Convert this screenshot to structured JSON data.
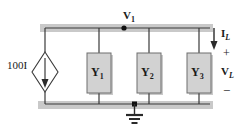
{
  "figure": {
    "colors": {
      "wire": "#3a3a3a",
      "box_fill": "#d2d2d2",
      "box_border": "#6e6e6e",
      "shadow": "#c9c9c9",
      "background": "#ffffff",
      "text": "#1a1a1a"
    }
  },
  "labels": {
    "source": "100I",
    "node_voltage": "V",
    "node_voltage_sub": "1",
    "load_current": "I",
    "load_current_sub": "L",
    "load_voltage": "V",
    "load_voltage_sub": "L",
    "polarity_plus": "+",
    "polarity_minus": "−"
  },
  "elements": [
    {
      "name": "admittance-1",
      "symbol": "Y",
      "subscript": "1"
    },
    {
      "name": "admittance-2",
      "symbol": "Y",
      "subscript": "2"
    },
    {
      "name": "admittance-3",
      "symbol": "Y",
      "subscript": "3"
    }
  ],
  "nodes": {
    "top_node": "V1",
    "ground": "ground"
  }
}
